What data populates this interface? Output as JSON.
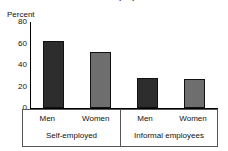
{
  "chart_data": {
    "type": "bar",
    "title": "Informal employment",
    "ylabel": "Percent",
    "xlabel": "",
    "ylim": [
      0,
      80
    ],
    "yticks": [
      80,
      60,
      40,
      20,
      0
    ],
    "grid": false,
    "legend": "none",
    "categories": [
      "Men",
      "Women"
    ],
    "groups": [
      {
        "name": "Self-employed",
        "bars": [
          {
            "label": "Men",
            "value": 62,
            "color": "#2d2d2d"
          },
          {
            "label": "Women",
            "value": 52,
            "color": "#6e6e6e"
          }
        ]
      },
      {
        "name": "Informal employees",
        "bars": [
          {
            "label": "Men",
            "value": 28,
            "color": "#2d2d2d"
          },
          {
            "label": "Women",
            "value": 27,
            "color": "#6e6e6e"
          }
        ]
      }
    ],
    "series": [
      {
        "name": "Men",
        "values": [
          62,
          28
        ],
        "color": "#2d2d2d"
      },
      {
        "name": "Women",
        "values": [
          52,
          27
        ],
        "color": "#6e6e6e"
      }
    ],
    "x": [
      "Self-employed",
      "Informal employees"
    ]
  }
}
